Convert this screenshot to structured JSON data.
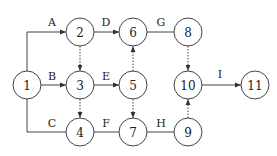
{
  "diagram": {
    "type": "activity-network",
    "nodes": [
      {
        "id": "1",
        "label": "1",
        "x": 27,
        "y": 85
      },
      {
        "id": "2",
        "label": "2",
        "x": 80,
        "y": 32
      },
      {
        "id": "3",
        "label": "3",
        "x": 80,
        "y": 85
      },
      {
        "id": "4",
        "label": "4",
        "x": 80,
        "y": 132
      },
      {
        "id": "5",
        "label": "5",
        "x": 133,
        "y": 85
      },
      {
        "id": "6",
        "label": "6",
        "x": 133,
        "y": 32
      },
      {
        "id": "7",
        "label": "7",
        "x": 133,
        "y": 132
      },
      {
        "id": "8",
        "label": "8",
        "x": 188,
        "y": 32
      },
      {
        "id": "9",
        "label": "9",
        "x": 188,
        "y": 132
      },
      {
        "id": "10",
        "label": "10",
        "x": 188,
        "y": 85
      },
      {
        "id": "11",
        "label": "11",
        "x": 255,
        "y": 85
      }
    ],
    "edges": [
      {
        "from": "1",
        "to": "2",
        "label": "A",
        "arrow": true
      },
      {
        "from": "1",
        "to": "3",
        "label": "B",
        "arrow": true
      },
      {
        "from": "1",
        "to": "4",
        "label": "C",
        "arrow": false
      },
      {
        "from": "2",
        "to": "6",
        "label": "D",
        "arrow": true
      },
      {
        "from": "3",
        "to": "5",
        "label": "E",
        "arrow": true
      },
      {
        "from": "4",
        "to": "7",
        "label": "F",
        "arrow": false
      },
      {
        "from": "6",
        "to": "8",
        "label": "G",
        "arrow": false
      },
      {
        "from": "7",
        "to": "9",
        "label": "H",
        "arrow": false
      },
      {
        "from": "10",
        "to": "11",
        "label": "I",
        "arrow": true
      },
      {
        "from": "2",
        "to": "3",
        "label": "",
        "arrow": true,
        "dummy": true
      },
      {
        "from": "3",
        "to": "4",
        "label": "",
        "arrow": true,
        "dummy": true
      },
      {
        "from": "5",
        "to": "6",
        "label": "",
        "arrow": true,
        "dummy": true
      },
      {
        "from": "5",
        "to": "7",
        "label": "",
        "arrow": true,
        "dummy": true
      },
      {
        "from": "8",
        "to": "10",
        "label": "",
        "arrow": true,
        "dummy": true
      },
      {
        "from": "9",
        "to": "10",
        "label": "",
        "arrow": true,
        "dummy": true
      }
    ],
    "labels": {
      "A": "A",
      "B": "B",
      "C": "C",
      "D": "D",
      "E": "E",
      "F": "F",
      "G": "G",
      "H": "H",
      "I": "I"
    }
  }
}
